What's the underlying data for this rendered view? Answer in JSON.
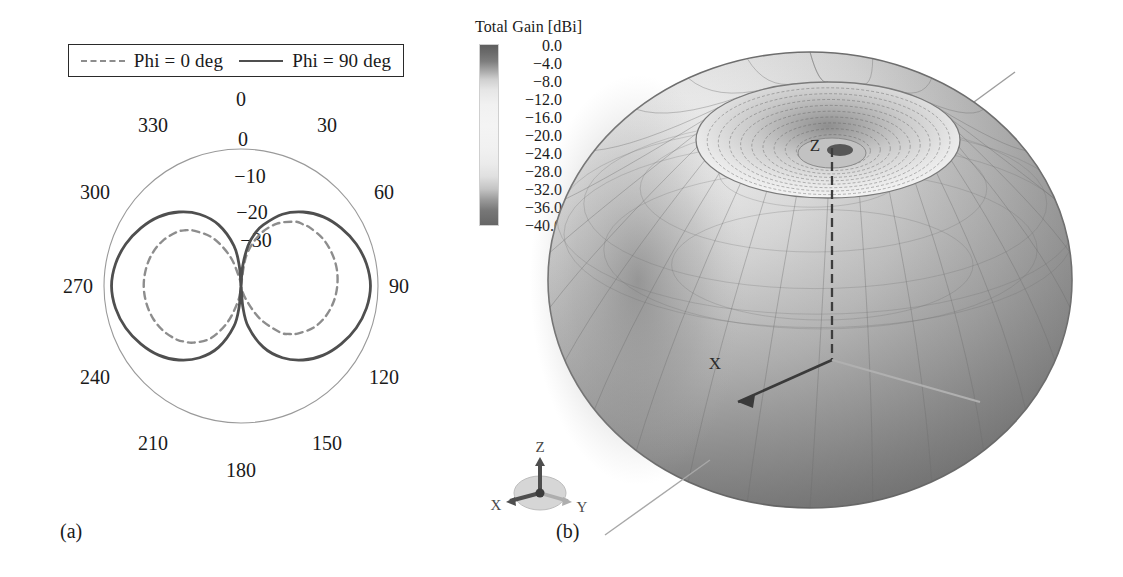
{
  "figure": {
    "panel_a_caption": "(a)",
    "panel_b_caption": "(b)"
  },
  "panel_a": {
    "legend": {
      "entries": [
        {
          "label": "Phi = 0 deg",
          "style": "dashed",
          "color": "#8d8d8d"
        },
        {
          "label": "Phi = 90 deg",
          "style": "solid",
          "color": "#4f4f4f"
        }
      ]
    },
    "angle_labels": [
      "0",
      "30",
      "60",
      "90",
      "120",
      "150",
      "180",
      "210",
      "240",
      "270",
      "300",
      "330"
    ],
    "radial_labels": [
      "0",
      "−10",
      "−20",
      "−30"
    ]
  },
  "panel_b": {
    "colorbar": {
      "title": "Total Gain [dBi]",
      "ticks": [
        "0.0",
        "−4.0",
        "−8.0",
        "−12.0",
        "−16.0",
        "−20.0",
        "−24.0",
        "−28.0",
        "−32.0",
        "−36.0",
        "−40.0"
      ],
      "max": 0.0,
      "min": -40.0,
      "step": -4.0,
      "colormap": "grayscale"
    },
    "plot_axis_labels": [
      "Z",
      "X"
    ],
    "triad_labels": [
      "Z",
      "X",
      "Y"
    ]
  },
  "chart_data": [
    {
      "type": "line",
      "plot_style": "polar",
      "title": "",
      "xlabel": "",
      "ylabel": "",
      "angle_unit": "deg",
      "angle_ticks": [
        0,
        30,
        60,
        90,
        120,
        150,
        180,
        210,
        240,
        270,
        300,
        330
      ],
      "radial_ticks": [
        0,
        -10,
        -20,
        -30
      ],
      "rlim": [
        -40,
        0
      ],
      "radial_unit": "dBi",
      "grid": false,
      "legend_position": "above-plot",
      "series": [
        {
          "name": "Phi = 0 deg",
          "style": "dashed",
          "color": "#8d8d8d",
          "angles": [
            0,
            10,
            20,
            30,
            40,
            45,
            50,
            60,
            70,
            80,
            90,
            100,
            110,
            120,
            130,
            135,
            140,
            150,
            160,
            170,
            180,
            190,
            200,
            210,
            220,
            225,
            230,
            240,
            250,
            260,
            270,
            280,
            290,
            300,
            310,
            315,
            320,
            330,
            340,
            350,
            360
          ],
          "values": [
            -40,
            -31,
            -24,
            -19,
            -15.5,
            -14.5,
            -13.6,
            -12.4,
            -11.8,
            -11.6,
            -11.9,
            -12.6,
            -13.8,
            -15.6,
            -18.4,
            -20.2,
            -22.4,
            -29,
            -36,
            -40,
            -40,
            -36,
            -29,
            -22.4,
            -18.4,
            -17,
            -15.6,
            -13.8,
            -12.6,
            -11.9,
            -11.6,
            -11.8,
            -12.4,
            -13.6,
            -15.5,
            -17,
            -19,
            -24,
            -31,
            -38,
            -40
          ]
        },
        {
          "name": "Phi = 90 deg",
          "style": "solid",
          "color": "#4f4f4f",
          "angles": [
            0,
            5,
            10,
            15,
            20,
            30,
            40,
            50,
            60,
            70,
            80,
            90,
            100,
            110,
            120,
            130,
            140,
            150,
            160,
            170,
            175,
            180,
            185,
            190,
            200,
            210,
            220,
            230,
            240,
            250,
            260,
            270,
            280,
            290,
            300,
            310,
            320,
            330,
            340,
            350,
            355,
            360
          ],
          "values": [
            -40,
            -34,
            -28,
            -24,
            -21,
            -15.8,
            -11.8,
            -8.6,
            -6.2,
            -4.2,
            -2.8,
            -2.2,
            -2.8,
            -4.2,
            -6.2,
            -8.6,
            -11.8,
            -15.8,
            -21,
            -28,
            -34,
            -40,
            -34,
            -28,
            -21,
            -15.8,
            -11.8,
            -8.6,
            -6.2,
            -4.2,
            -2.8,
            -2.2,
            -2.8,
            -4.2,
            -6.2,
            -8.6,
            -11.8,
            -15.8,
            -21,
            -28,
            -34,
            -40
          ]
        }
      ]
    },
    {
      "type": "surface",
      "plot_style": "3d-radiation-pattern",
      "title": "",
      "colorbar_label": "Total Gain [dBi]",
      "colorbar_ticks": [
        0.0,
        -4.0,
        -8.0,
        -12.0,
        -16.0,
        -20.0,
        -24.0,
        -28.0,
        -32.0,
        -36.0,
        -40.0
      ],
      "zlim": [
        -40.0,
        0.0
      ],
      "axes": [
        "X",
        "Y",
        "Z"
      ],
      "description": "Toroidal (doughnut) omnidirectional dipole pattern with nulls along the Z axis"
    }
  ]
}
